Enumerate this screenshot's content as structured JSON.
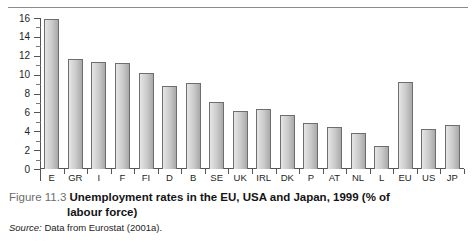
{
  "figure": {
    "number_label": "Figure 11.3",
    "caption_line1": "Unemployment rates in the EU, USA and Japan, 1999 (% of",
    "caption_line2": "labour force)",
    "source_label": "Source:",
    "source_text": "Data from Eurostat (2001a)."
  },
  "chart_data": {
    "type": "bar",
    "title": "Unemployment rates in the EU, USA and Japan, 1999 (% of labour force)",
    "xlabel": "",
    "ylabel": "",
    "ylim": [
      0,
      16
    ],
    "ytick_values": [
      0,
      2,
      4,
      6,
      8,
      10,
      12,
      14,
      16
    ],
    "ytick_labels": [
      "0",
      "2",
      "4",
      "6",
      "8",
      "10",
      "12",
      "14",
      "16"
    ],
    "minor_tick_step": 1,
    "grid": false,
    "legend": "none",
    "categories": [
      "E",
      "GR",
      "I",
      "F",
      "FI",
      "D",
      "B",
      "SE",
      "UK",
      "IRL",
      "DK",
      "P",
      "AT",
      "NL",
      "L",
      "EU",
      "US",
      "JP"
    ],
    "values": [
      15.9,
      11.7,
      11.3,
      11.2,
      10.2,
      8.8,
      9.1,
      7.1,
      6.1,
      6.4,
      5.7,
      4.9,
      4.4,
      3.8,
      2.4,
      9.2,
      4.2,
      4.7
    ],
    "units": "% of labour force",
    "bar_face_color": "#cfcfcf",
    "bar_edge_color": "#6e6e6e",
    "axis_color": "#555555",
    "background_color": "#ffffff"
  }
}
